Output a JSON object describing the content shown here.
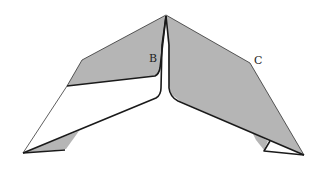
{
  "diagram": {
    "type": "origami-fold-diagram",
    "labels": {
      "point_b": "B",
      "point_c": "C"
    },
    "colors": {
      "flap_fill": "#b5b5b5",
      "paper_fill": "#ffffff",
      "edge_stroke": "#1a1a1a",
      "background": "#ffffff"
    }
  }
}
